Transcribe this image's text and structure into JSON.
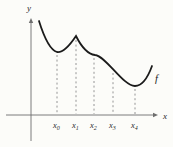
{
  "figure": {
    "background": "#fcfcf9",
    "colors": {
      "curve": "#1b1b1b",
      "axis": "#6e6e6e",
      "dash": "#8a8a8a",
      "label": "#2b2b2b"
    },
    "y_axis": {
      "label": "y",
      "x": 31,
      "y_top": 18,
      "y_bottom": 141,
      "label_x": 27,
      "label_y": 11,
      "font_size": 9
    },
    "x_axis": {
      "label": "x",
      "y": 115,
      "x_left": 6,
      "x_right": 158,
      "label_x": 163,
      "label_y": 118.5,
      "font_size": 9
    },
    "curve": {
      "label": "f",
      "label_x": 155,
      "label_y": 82,
      "font_size": 10.5,
      "stroke_width": 1.8,
      "path": "M 39,21 C 44,37 50,50 57,52 C 63,53 70,45 76,36 C 80,44 87,54 95,55 C 106,56 123,86 135,86 C 142,86 148,77 152,66"
    },
    "ticks": [
      {
        "base": "x",
        "sub": "0",
        "x": 57,
        "dash_top": 55
      },
      {
        "base": "x",
        "sub": "1",
        "x": 76,
        "dash_top": 40
      },
      {
        "base": "x",
        "sub": "2",
        "x": 94,
        "dash_top": 58
      },
      {
        "base": "x",
        "sub": "3",
        "x": 113,
        "dash_top": 73
      },
      {
        "base": "x",
        "sub": "4",
        "x": 135,
        "dash_top": 89
      }
    ],
    "tick_label_baseline_y": 128,
    "tick_font_size": 8.5,
    "tick_sub_font_size": 6,
    "dash_bottom": 114,
    "dash_pattern": "2,2.6"
  }
}
